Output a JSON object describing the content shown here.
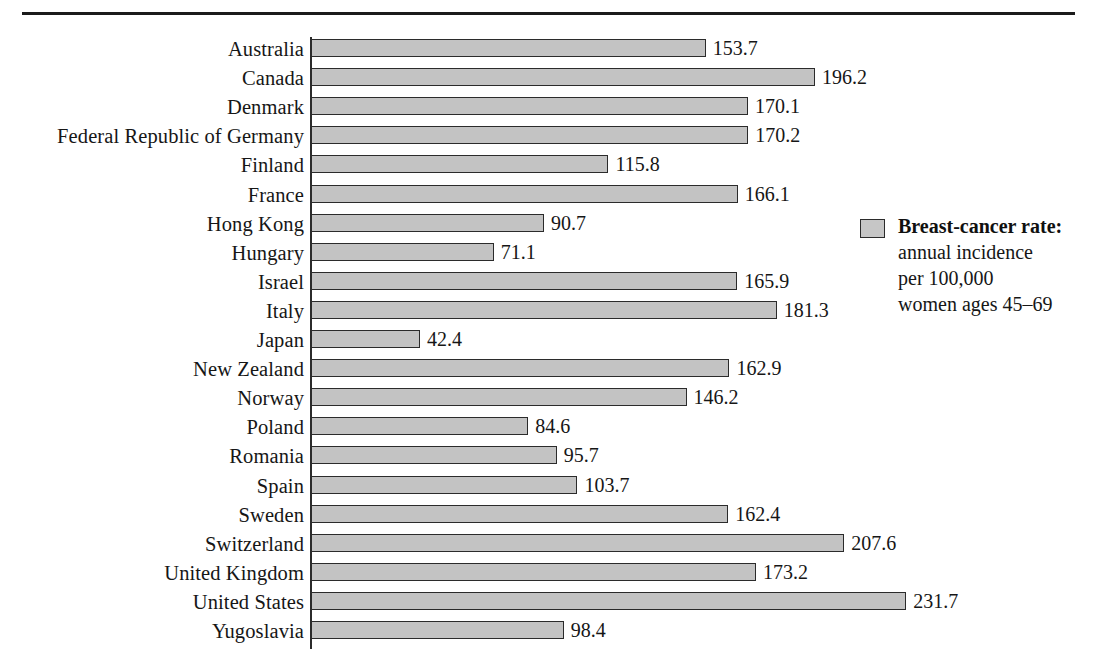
{
  "chart_data": {
    "type": "bar",
    "orientation": "horizontal",
    "title": "",
    "xlabel": "",
    "ylabel": "",
    "xlim": [
      0,
      231.7
    ],
    "grid": false,
    "legend_position": "right",
    "categories": [
      "Australia",
      "Canada",
      "Denmark",
      "Federal Republic of Germany",
      "Finland",
      "France",
      "Hong Kong",
      "Hungary",
      "Israel",
      "Italy",
      "Japan",
      "New Zealand",
      "Norway",
      "Poland",
      "Romania",
      "Spain",
      "Sweden",
      "Switzerland",
      "United Kingdom",
      "United States",
      "Yugoslavia"
    ],
    "values": [
      153.7,
      196.2,
      170.1,
      170.2,
      115.8,
      166.1,
      90.7,
      71.1,
      165.9,
      181.3,
      42.4,
      162.9,
      146.2,
      84.6,
      95.7,
      103.7,
      162.4,
      207.6,
      173.2,
      231.7,
      98.4
    ],
    "value_labels": [
      "153.7",
      "196.2",
      "170.1",
      "170.2",
      "115.8",
      "166.1",
      "90.7",
      "71.1",
      "165.9",
      "181.3",
      "42.4",
      "162.9",
      "146.2",
      "84.6",
      "95.7",
      "103.7",
      "162.4",
      "207.6",
      "173.2",
      "231.7",
      "98.4"
    ],
    "series": [
      {
        "name": "Breast-cancer rate",
        "values": [
          153.7,
          196.2,
          170.1,
          170.2,
          115.8,
          166.1,
          90.7,
          71.1,
          165.9,
          181.3,
          42.4,
          162.9,
          146.2,
          84.6,
          95.7,
          103.7,
          162.4,
          207.6,
          173.2,
          231.7,
          98.4
        ]
      }
    ],
    "bar_fill_color": "#c3c3c3",
    "bar_border_color": "#2b2b2b"
  },
  "legend": {
    "swatch_color": "#c6c6c6",
    "title": "Breast-cancer rate:",
    "line1": "annual incidence",
    "line2": "per 100,000",
    "line3": "women ages 45–69"
  },
  "rule": {
    "color": "#1b1b1b"
  }
}
